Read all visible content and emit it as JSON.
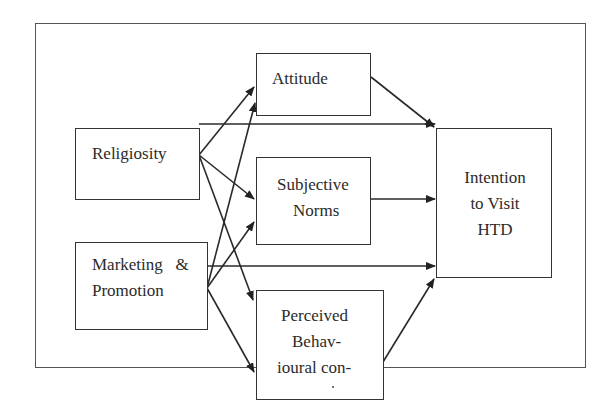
{
  "diagram": {
    "type": "path-model",
    "colors": {
      "stroke": "#333333",
      "frame": "#555555",
      "text": "#2b2b2b",
      "background": "#ffffff"
    },
    "nodes": {
      "religiosity": {
        "label": "Religiosity"
      },
      "marketing": {
        "line1": "Marketing   &",
        "line2": "Promotion"
      },
      "attitude": {
        "label": "Attitude"
      },
      "subjective_norms": {
        "line1": "Subjective",
        "line2": "Norms"
      },
      "perceived": {
        "line1": "Perceived",
        "line2": "Behav-",
        "line3": "ioural con-"
      },
      "intention": {
        "line1": "Intention",
        "line2": "to Visit",
        "line3": "HTD"
      }
    },
    "edges": [
      {
        "from": "Religiosity",
        "to": "Attitude"
      },
      {
        "from": "Religiosity",
        "to": "Subjective Norms"
      },
      {
        "from": "Religiosity",
        "to": "Perceived Behavioural control"
      },
      {
        "from": "Religiosity",
        "to": "Intention to Visit HTD"
      },
      {
        "from": "Marketing & Promotion",
        "to": "Attitude"
      },
      {
        "from": "Marketing & Promotion",
        "to": "Subjective Norms"
      },
      {
        "from": "Marketing & Promotion",
        "to": "Perceived Behavioural control"
      },
      {
        "from": "Marketing & Promotion",
        "to": "Intention to Visit HTD"
      },
      {
        "from": "Attitude",
        "to": "Intention to Visit HTD"
      },
      {
        "from": "Subjective Norms",
        "to": "Intention to Visit HTD"
      },
      {
        "from": "Perceived Behavioural control",
        "to": "Intention to Visit HTD"
      }
    ]
  }
}
